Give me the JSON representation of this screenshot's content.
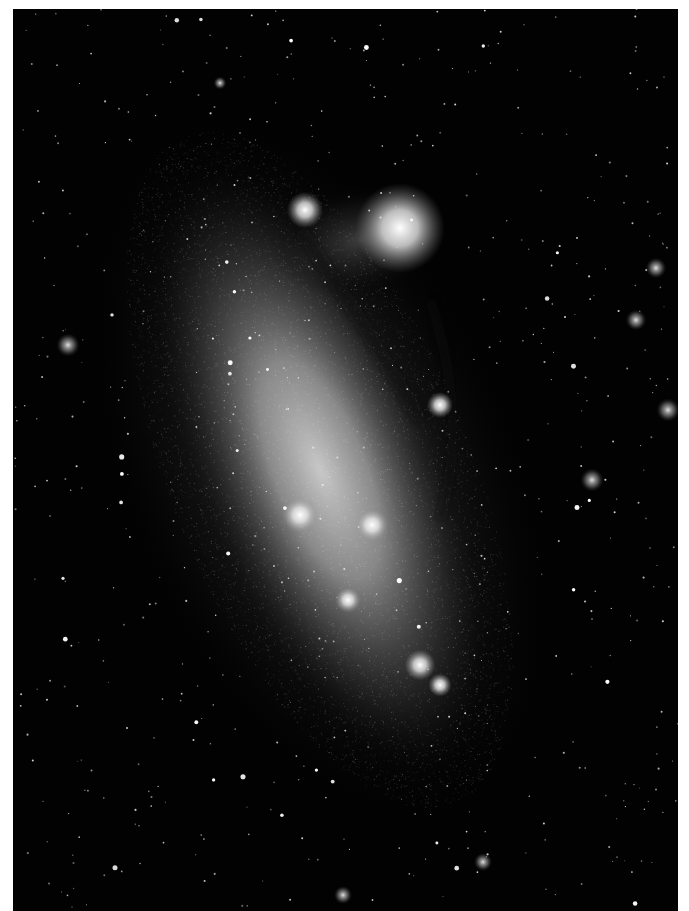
{
  "image": {
    "subject": "galaxy",
    "style": "black-and-white astronomical photograph",
    "colors": {
      "background": "#020202",
      "border": "#ffffff",
      "glow": "#d8d8d8",
      "star": "#ffffff"
    },
    "frame": {
      "left": 13,
      "top": 9,
      "right": 678,
      "bottom": 911
    },
    "features": [
      {
        "name": "main-bar",
        "type": "diffuse-glow",
        "cx": 320,
        "cy": 470,
        "rx": 130,
        "ry": 330,
        "rotation": -22
      },
      {
        "name": "northern-nebula-complex",
        "type": "bright-nebula",
        "cx": 400,
        "cy": 228,
        "r": 28
      },
      {
        "name": "nebula-knot-1",
        "type": "knot",
        "cx": 305,
        "cy": 210,
        "r": 14
      },
      {
        "name": "nebula-knot-2",
        "type": "knot",
        "cx": 440,
        "cy": 405,
        "r": 10
      },
      {
        "name": "nebula-knot-3",
        "type": "knot",
        "cx": 300,
        "cy": 515,
        "r": 14
      },
      {
        "name": "nebula-knot-4",
        "type": "knot",
        "cx": 372,
        "cy": 525,
        "r": 13
      },
      {
        "name": "nebula-knot-5",
        "type": "knot",
        "cx": 348,
        "cy": 600,
        "r": 10
      },
      {
        "name": "nebula-knot-6",
        "type": "knot",
        "cx": 420,
        "cy": 665,
        "r": 12
      },
      {
        "name": "nebula-knot-7",
        "type": "knot",
        "cx": 440,
        "cy": 685,
        "r": 9
      },
      {
        "name": "outer-cluster-1",
        "type": "cluster",
        "cx": 656,
        "cy": 268,
        "r": 8
      },
      {
        "name": "outer-cluster-2",
        "type": "cluster",
        "cx": 636,
        "cy": 320,
        "r": 8
      },
      {
        "name": "outer-cluster-3",
        "type": "cluster",
        "cx": 668,
        "cy": 410,
        "r": 9
      },
      {
        "name": "outer-cluster-4",
        "type": "cluster",
        "cx": 592,
        "cy": 480,
        "r": 9
      },
      {
        "name": "outer-cluster-5",
        "type": "cluster",
        "cx": 68,
        "cy": 345,
        "r": 9
      },
      {
        "name": "outer-cluster-6",
        "type": "cluster",
        "cx": 220,
        "cy": 83,
        "r": 5
      },
      {
        "name": "outer-cluster-7",
        "type": "cluster",
        "cx": 483,
        "cy": 862,
        "r": 7
      },
      {
        "name": "outer-cluster-8",
        "type": "cluster",
        "cx": 343,
        "cy": 895,
        "r": 7
      }
    ]
  }
}
